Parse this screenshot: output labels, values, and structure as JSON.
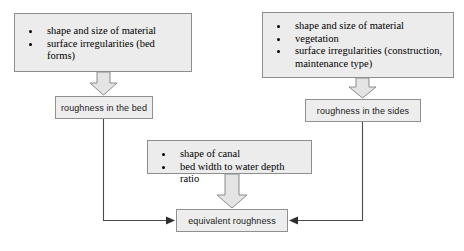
{
  "diagram": {
    "colors": {
      "box_fill": "#ececec",
      "box_border": "#8e8e8e",
      "arrow_fill": "#e4e4e4",
      "arrow_stroke": "#8a8a8a",
      "line": "#4a4a4a",
      "text": "#000000",
      "background": "#ffffff"
    },
    "nodes": {
      "bed_factors": {
        "label": "bed factors",
        "bullets": [
          "shape and size of material",
          "surface irregularities (bed forms)"
        ]
      },
      "side_factors": {
        "label": "side factors",
        "bullets": [
          "shape and size of material",
          "vegetation",
          "surface irregularities (construction,\nmaintenance type)"
        ]
      },
      "canal_factors": {
        "label": "canal factors",
        "bullets": [
          "shape of canal",
          "bed width to water depth ratio"
        ]
      },
      "bed_roughness": {
        "text": "roughness in the bed"
      },
      "side_roughness": {
        "text": "roughness in the sides"
      },
      "equivalent_roughness": {
        "text": "equivalent roughness"
      }
    },
    "connectors": [
      {
        "name": "bed-factors-to-bed-roughness",
        "style": "block-arrow-down"
      },
      {
        "name": "side-factors-to-side-roughness",
        "style": "block-arrow-down"
      },
      {
        "name": "canal-factors-to-equivalent",
        "style": "block-arrow-down"
      },
      {
        "name": "bed-roughness-to-equivalent",
        "style": "elbow-line-right"
      },
      {
        "name": "side-roughness-to-equivalent",
        "style": "elbow-line-left"
      }
    ]
  }
}
